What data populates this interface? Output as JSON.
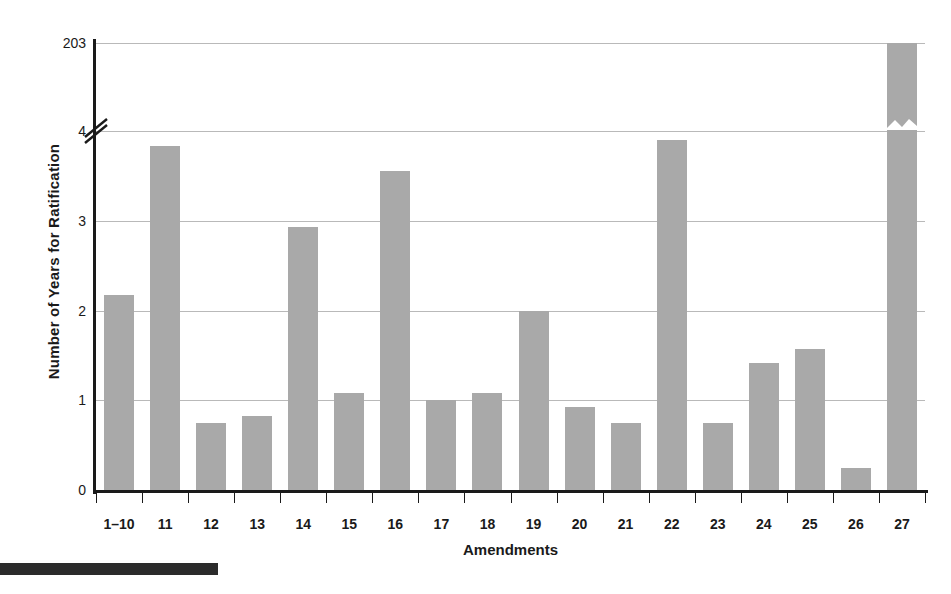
{
  "chart_data": {
    "type": "bar",
    "title": "",
    "xlabel": "Amendments",
    "ylabel": "Number of Years for Ratification",
    "categories": [
      "1–10",
      "11",
      "12",
      "13",
      "14",
      "15",
      "16",
      "17",
      "18",
      "19",
      "20",
      "21",
      "22",
      "23",
      "24",
      "25",
      "26",
      "27"
    ],
    "values": [
      2.17,
      3.83,
      0.75,
      0.83,
      2.93,
      1.08,
      3.55,
      1.0,
      1.08,
      2.0,
      0.92,
      0.75,
      3.9,
      0.75,
      1.42,
      1.57,
      0.25,
      203
    ],
    "ytick_labels": [
      "0",
      "1",
      "2",
      "3",
      "4",
      "203"
    ],
    "ytick_values": [
      0,
      1,
      2,
      3,
      4,
      203
    ],
    "ylim": [
      0,
      203
    ],
    "axis_break": {
      "present": true,
      "between": [
        4,
        203
      ],
      "note": "y-axis broken between 4 and 203"
    },
    "grid": "horizontal",
    "legend": "none",
    "bar_color": "#a9a9a9",
    "axis_color": "#1a1a1a",
    "gridline_color": "#b9b9b9"
  },
  "figure": {
    "page_rule_color": "#2b2b2b"
  }
}
